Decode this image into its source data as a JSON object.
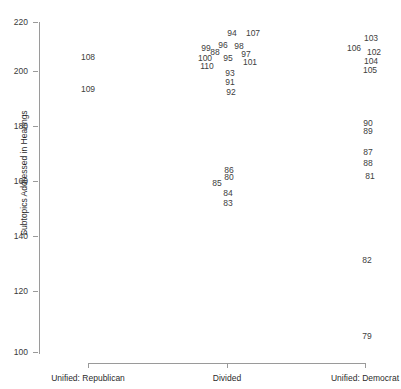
{
  "chart_data": {
    "type": "scatter",
    "title": "",
    "xlabel": "",
    "ylabel": "Subtopics Addressed in Hearings",
    "ylim": [
      100,
      220
    ],
    "ytick_labels": [
      "220",
      "200",
      "180",
      "160",
      "140",
      "120",
      "100"
    ],
    "ytick_values": [
      220,
      200,
      180,
      160,
      140,
      120,
      100
    ],
    "categories": [
      "Unified: Republican",
      "Divided",
      "Unified: Democrat"
    ],
    "grid": false,
    "legend": null,
    "point_label_note": "Each plotted point is drawn as its Congress number label",
    "points": [
      {
        "label": "108",
        "category": "Unified: Republican",
        "x_px": 88,
        "y_px": 57,
        "y": 206
      },
      {
        "label": "109",
        "category": "Unified: Republican",
        "x_px": 88,
        "y_px": 89,
        "y": 194
      },
      {
        "label": "94",
        "category": "Divided",
        "x_px": 232,
        "y_px": 33,
        "y": 215
      },
      {
        "label": "107",
        "category": "Divided",
        "x_px": 253,
        "y_px": 33,
        "y": 215
      },
      {
        "label": "99",
        "category": "Divided",
        "x_px": 206,
        "y_px": 48,
        "y": 209
      },
      {
        "label": "96",
        "category": "Divided",
        "x_px": 223,
        "y_px": 45,
        "y": 210
      },
      {
        "label": "98",
        "category": "Divided",
        "x_px": 239,
        "y_px": 46,
        "y": 210
      },
      {
        "label": "88",
        "category": "Divided",
        "x_px": 215,
        "y_px": 52,
        "y": 208
      },
      {
        "label": "97",
        "category": "Divided",
        "x_px": 246,
        "y_px": 54,
        "y": 207
      },
      {
        "label": "100",
        "category": "Divided",
        "x_px": 205,
        "y_px": 58,
        "y": 206
      },
      {
        "label": "95",
        "category": "Divided",
        "x_px": 228,
        "y_px": 58,
        "y": 206
      },
      {
        "label": "101",
        "category": "Divided",
        "x_px": 250,
        "y_px": 62,
        "y": 204
      },
      {
        "label": "110",
        "category": "Divided",
        "x_px": 207,
        "y_px": 66,
        "y": 203
      },
      {
        "label": "93",
        "category": "Divided",
        "x_px": 230,
        "y_px": 73,
        "y": 200
      },
      {
        "label": "91",
        "category": "Divided",
        "x_px": 230,
        "y_px": 82,
        "y": 197
      },
      {
        "label": "92",
        "category": "Divided",
        "x_px": 231,
        "y_px": 92,
        "y": 193
      },
      {
        "label": "86",
        "category": "Divided",
        "x_px": 229,
        "y_px": 170,
        "y": 164
      },
      {
        "label": "80",
        "category": "Divided",
        "x_px": 229,
        "y_px": 177,
        "y": 161
      },
      {
        "label": "85",
        "category": "Divided",
        "x_px": 217,
        "y_px": 183,
        "y": 159
      },
      {
        "label": "84",
        "category": "Divided",
        "x_px": 228,
        "y_px": 193,
        "y": 155
      },
      {
        "label": "83",
        "category": "Divided",
        "x_px": 228,
        "y_px": 203,
        "y": 152
      },
      {
        "label": "103",
        "category": "Unified: Democrat",
        "x_px": 371,
        "y_px": 38,
        "y": 213
      },
      {
        "label": "106",
        "category": "Unified: Democrat",
        "x_px": 354,
        "y_px": 48,
        "y": 209
      },
      {
        "label": "102",
        "category": "Unified: Democrat",
        "x_px": 374,
        "y_px": 52,
        "y": 208
      },
      {
        "label": "104",
        "category": "Unified: Democrat",
        "x_px": 371,
        "y_px": 61,
        "y": 205
      },
      {
        "label": "105",
        "category": "Unified: Democrat",
        "x_px": 370,
        "y_px": 70,
        "y": 202
      },
      {
        "label": "90",
        "category": "Unified: Democrat",
        "x_px": 368,
        "y_px": 123,
        "y": 182
      },
      {
        "label": "89",
        "category": "Unified: Democrat",
        "x_px": 368,
        "y_px": 131,
        "y": 179
      },
      {
        "label": "87",
        "category": "Unified: Democrat",
        "x_px": 368,
        "y_px": 152,
        "y": 172
      },
      {
        "label": "88",
        "category": "Unified: Democrat",
        "x_px": 368,
        "y_px": 163,
        "y": 167
      },
      {
        "label": "81",
        "category": "Unified: Democrat",
        "x_px": 370,
        "y_px": 176,
        "y": 162
      },
      {
        "label": "82",
        "category": "Unified: Democrat",
        "x_px": 367,
        "y_px": 260,
        "y": 131
      },
      {
        "label": "79",
        "category": "Unified: Democrat",
        "x_px": 367,
        "y_px": 336,
        "y": 103
      }
    ]
  },
  "axes": {
    "y_ticks": [
      {
        "label": "220",
        "y_px": 22
      },
      {
        "label": "200",
        "y_px": 71
      },
      {
        "label": "180",
        "y_px": 126
      },
      {
        "label": "160",
        "y_px": 181
      },
      {
        "label": "140",
        "y_px": 236
      },
      {
        "label": "120",
        "y_px": 291
      },
      {
        "label": "100",
        "y_px": 352
      }
    ],
    "x_ticks": [
      {
        "label": "Unified: Republican",
        "x_px": 88
      },
      {
        "label": "Divided",
        "x_px": 227
      },
      {
        "label": "Unified: Democrat",
        "x_px": 365
      }
    ],
    "y_title": "Subtopics Addressed in Hearings"
  },
  "colors": {
    "axis": "#9a9a9a",
    "text": "#2b2b2b",
    "point_text": "#404040",
    "background": "#ffffff"
  }
}
